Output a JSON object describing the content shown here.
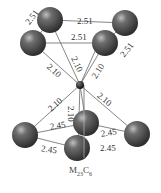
{
  "diagram": {
    "title": "M23C6",
    "caption": {
      "base1": "M",
      "sub1": "23",
      "base2": "C",
      "sub2": "6"
    },
    "colors": {
      "metal_atom": "#555555",
      "carbon_atom": "#222222",
      "bond": "#666666",
      "label": "#333333"
    },
    "top_square_labels": [
      "2.51",
      "2.51",
      "2.51",
      "2.51"
    ],
    "top_bond_labels": [
      "2.10",
      "2.10",
      "2.10"
    ],
    "bottom_bond_labels": [
      "2.10",
      "2.10",
      "2.10"
    ],
    "bottom_square_labels": [
      "2.45",
      "2.45",
      "2.45",
      "2.45"
    ]
  }
}
